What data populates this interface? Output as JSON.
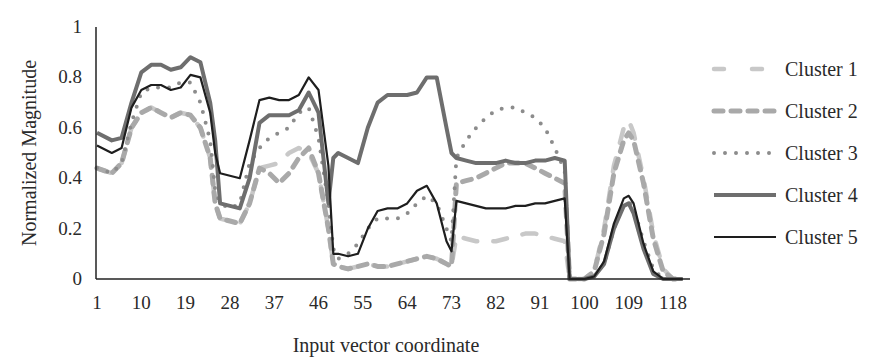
{
  "chart_data": {
    "type": "line",
    "title": "",
    "xlabel": "Input vector coordinate",
    "ylabel": "Normalized Magnitude",
    "ylim": [
      0,
      1
    ],
    "xlim": [
      1,
      120
    ],
    "yticks": [
      "0",
      "0.2",
      "0.4",
      "0.6",
      "0.8",
      "1"
    ],
    "xticks": [
      "1",
      "10",
      "19",
      "28",
      "37",
      "46",
      "55",
      "64",
      "73",
      "82",
      "91",
      "100",
      "109",
      "118"
    ],
    "grid": false,
    "legend_position": "right",
    "x": [
      1,
      4,
      6,
      8,
      10,
      12,
      14,
      16,
      18,
      20,
      22,
      24,
      25,
      26,
      28,
      30,
      32,
      34,
      36,
      38,
      40,
      42,
      44,
      46,
      48,
      49,
      50,
      52,
      54,
      56,
      58,
      60,
      62,
      64,
      66,
      68,
      70,
      72,
      73,
      74,
      76,
      78,
      80,
      82,
      84,
      86,
      88,
      90,
      92,
      94,
      96,
      97,
      98,
      100,
      102,
      104,
      106,
      108,
      109,
      110,
      112,
      114,
      116,
      118,
      120
    ],
    "series": [
      {
        "name": "Cluster 1",
        "style": "long-dash",
        "color": "#c8c8c8",
        "values": [
          0.44,
          0.42,
          0.46,
          0.6,
          0.66,
          0.68,
          0.66,
          0.64,
          0.66,
          0.65,
          0.6,
          0.48,
          0.3,
          0.24,
          0.23,
          0.22,
          0.3,
          0.44,
          0.45,
          0.46,
          0.5,
          0.52,
          0.5,
          0.42,
          0.2,
          0.06,
          0.05,
          0.04,
          0.05,
          0.06,
          0.05,
          0.05,
          0.06,
          0.07,
          0.08,
          0.09,
          0.08,
          0.06,
          0.05,
          0.17,
          0.16,
          0.15,
          0.15,
          0.15,
          0.16,
          0.17,
          0.18,
          0.18,
          0.17,
          0.16,
          0.15,
          0.0,
          0.0,
          0.0,
          0.03,
          0.2,
          0.45,
          0.6,
          0.63,
          0.58,
          0.4,
          0.18,
          0.04,
          0.0,
          0.0
        ]
      },
      {
        "name": "Cluster 2",
        "style": "dash",
        "color": "#a9a9a9",
        "values": [
          0.44,
          0.42,
          0.46,
          0.6,
          0.66,
          0.68,
          0.66,
          0.64,
          0.66,
          0.65,
          0.6,
          0.48,
          0.3,
          0.24,
          0.23,
          0.22,
          0.3,
          0.44,
          0.42,
          0.38,
          0.42,
          0.48,
          0.52,
          0.42,
          0.2,
          0.06,
          0.05,
          0.04,
          0.05,
          0.06,
          0.05,
          0.05,
          0.06,
          0.07,
          0.08,
          0.09,
          0.08,
          0.06,
          0.05,
          0.38,
          0.39,
          0.4,
          0.42,
          0.44,
          0.46,
          0.46,
          0.46,
          0.44,
          0.42,
          0.4,
          0.38,
          0.0,
          0.0,
          0.0,
          0.03,
          0.18,
          0.42,
          0.55,
          0.58,
          0.55,
          0.38,
          0.16,
          0.03,
          0.0,
          0.0
        ]
      },
      {
        "name": "Cluster 3",
        "style": "dotted",
        "color": "#8c8c8c",
        "values": [
          0.44,
          0.42,
          0.46,
          0.62,
          0.74,
          0.76,
          0.76,
          0.76,
          0.78,
          0.78,
          0.7,
          0.55,
          0.35,
          0.3,
          0.28,
          0.3,
          0.46,
          0.52,
          0.56,
          0.58,
          0.6,
          0.66,
          0.68,
          0.56,
          0.3,
          0.12,
          0.08,
          0.1,
          0.14,
          0.2,
          0.24,
          0.24,
          0.24,
          0.26,
          0.3,
          0.33,
          0.3,
          0.2,
          0.15,
          0.48,
          0.55,
          0.6,
          0.64,
          0.67,
          0.68,
          0.68,
          0.66,
          0.64,
          0.6,
          0.52,
          0.43,
          0.0,
          0.0,
          0.0,
          0.01,
          0.06,
          0.2,
          0.3,
          0.31,
          0.28,
          0.15,
          0.04,
          0.0,
          0.0,
          0.0
        ]
      },
      {
        "name": "Cluster 4",
        "style": "solid-thick",
        "color": "#6e6e6e",
        "values": [
          0.58,
          0.55,
          0.56,
          0.7,
          0.82,
          0.85,
          0.85,
          0.83,
          0.84,
          0.88,
          0.86,
          0.7,
          0.55,
          0.3,
          0.29,
          0.28,
          0.4,
          0.62,
          0.65,
          0.65,
          0.65,
          0.67,
          0.74,
          0.66,
          0.3,
          0.48,
          0.5,
          0.48,
          0.46,
          0.6,
          0.7,
          0.73,
          0.73,
          0.73,
          0.74,
          0.8,
          0.8,
          0.6,
          0.5,
          0.48,
          0.47,
          0.46,
          0.46,
          0.46,
          0.47,
          0.46,
          0.46,
          0.47,
          0.47,
          0.48,
          0.47,
          0.0,
          0.0,
          0.0,
          0.01,
          0.06,
          0.2,
          0.29,
          0.3,
          0.26,
          0.12,
          0.02,
          0.0,
          0.0,
          0.0
        ]
      },
      {
        "name": "Cluster 5",
        "style": "solid-thin",
        "color": "#1e1e1e",
        "values": [
          0.53,
          0.5,
          0.52,
          0.68,
          0.75,
          0.77,
          0.77,
          0.75,
          0.76,
          0.81,
          0.8,
          0.66,
          0.5,
          0.42,
          0.41,
          0.4,
          0.55,
          0.71,
          0.72,
          0.71,
          0.71,
          0.73,
          0.8,
          0.75,
          0.45,
          0.1,
          0.1,
          0.09,
          0.1,
          0.2,
          0.27,
          0.28,
          0.28,
          0.3,
          0.35,
          0.37,
          0.3,
          0.15,
          0.11,
          0.31,
          0.3,
          0.29,
          0.28,
          0.28,
          0.28,
          0.29,
          0.29,
          0.3,
          0.3,
          0.31,
          0.32,
          0.0,
          0.0,
          0.0,
          0.01,
          0.07,
          0.22,
          0.32,
          0.33,
          0.3,
          0.14,
          0.03,
          0.0,
          0.0,
          0.0
        ]
      }
    ]
  },
  "legend": {
    "items": [
      {
        "label": "Cluster 1"
      },
      {
        "label": "Cluster 2"
      },
      {
        "label": "Cluster 3"
      },
      {
        "label": "Cluster 4"
      },
      {
        "label": "Cluster 5"
      }
    ]
  }
}
